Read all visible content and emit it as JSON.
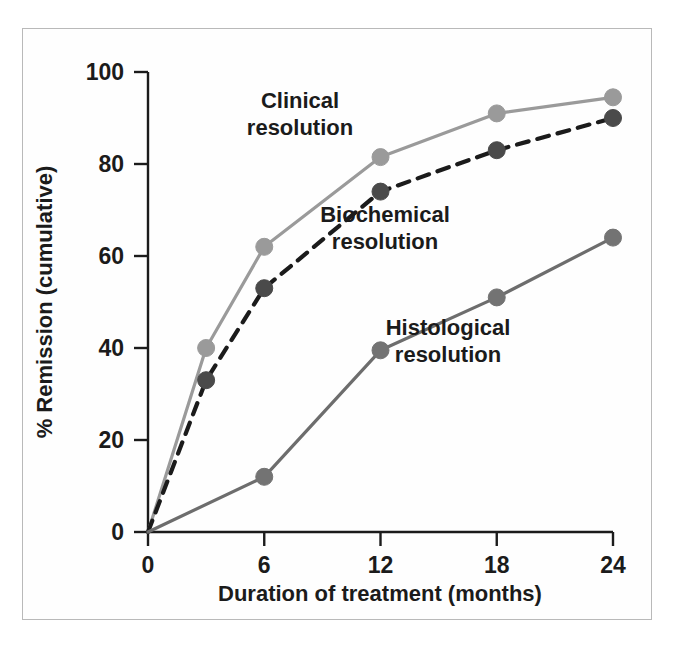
{
  "chart_data": {
    "type": "line",
    "title": "",
    "xlabel": "Duration of treatment (months)",
    "ylabel": "% Remission (cumulative)",
    "xlim": [
      0,
      24
    ],
    "ylim": [
      0,
      100
    ],
    "xticks": [
      0,
      6,
      12,
      18,
      24
    ],
    "yticks": [
      0,
      20,
      40,
      60,
      80,
      100
    ],
    "xtick_labels": [
      "0",
      "6",
      "12",
      "18",
      "24"
    ],
    "ytick_labels": [
      "0",
      "20",
      "40",
      "60",
      "80",
      "100"
    ],
    "grid": false,
    "legend_position": "inline-annotations",
    "series": [
      {
        "name": "Clinical resolution",
        "style": "solid",
        "color": "#9a9a9a",
        "marker": "circle",
        "marker_color": "#9a9a9a",
        "x": [
          0,
          3,
          6,
          12,
          18,
          24
        ],
        "values": [
          0,
          40,
          62,
          81.5,
          91,
          94.5
        ]
      },
      {
        "name": "Biochemical resolution",
        "style": "dashed",
        "color": "#1b1b1b",
        "marker": "circle",
        "marker_color": "#4a4a4a",
        "x": [
          0,
          3,
          6,
          12,
          18,
          24
        ],
        "values": [
          0,
          33,
          53,
          74,
          83,
          90
        ]
      },
      {
        "name": "Histological resolution",
        "style": "solid",
        "color": "#6d6d6d",
        "marker": "circle",
        "marker_color": "#737373",
        "x": [
          0,
          6,
          12,
          18,
          24
        ],
        "values": [
          0,
          12,
          39.5,
          51,
          64
        ]
      }
    ],
    "annotations": [
      {
        "text_line1": "Clinical",
        "text_line2": "resolution",
        "x_px": 300,
        "y_px": 108
      },
      {
        "text_line1": "Biochemical",
        "text_line2": "resolution",
        "x_px": 385,
        "y_px": 222
      },
      {
        "text_line1": "Histological",
        "text_line2": "resolution",
        "x_px": 448,
        "y_px": 335
      }
    ]
  }
}
